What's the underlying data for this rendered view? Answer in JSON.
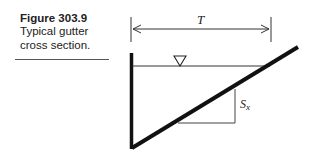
{
  "caption": {
    "title": "Figure 303.9",
    "description_line1": "Typical gutter",
    "description_line2": "cross section."
  },
  "diagram": {
    "type": "gutter-cross-section",
    "top_width_label": "T",
    "slope_label_main": "S",
    "slope_label_sub": "x",
    "water_surface_symbol": "inverted-triangle",
    "colors": {
      "stroke": "#111111",
      "thin": "#333333",
      "background": "#ffffff"
    }
  }
}
